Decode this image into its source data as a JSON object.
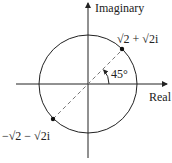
{
  "diagram": {
    "axes": {
      "x_label": "Real",
      "y_label": "Imaginary"
    },
    "circle": {
      "center": "origin",
      "radius_label": ""
    },
    "points": [
      {
        "name": "upper",
        "label_parts": [
          "√",
          "2",
          " + ",
          "√",
          "2",
          "i"
        ],
        "label": "√2 + √2i"
      },
      {
        "name": "lower",
        "label_parts": [
          "−",
          "√",
          "2",
          " − ",
          "√",
          "2",
          "i"
        ],
        "label": "−√2 − √2i"
      }
    ],
    "angle": {
      "label": "45°"
    },
    "colors": {
      "stroke": "#222222",
      "dashed": "#777777"
    }
  }
}
